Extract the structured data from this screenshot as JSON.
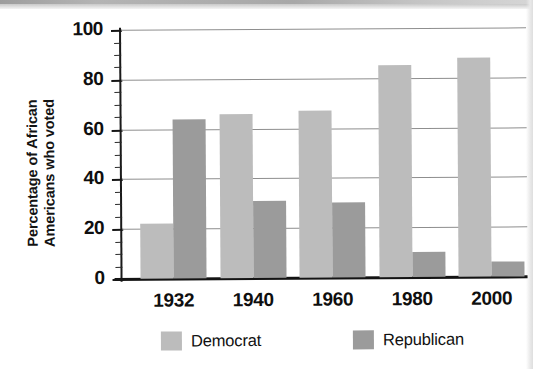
{
  "chart_data": {
    "type": "bar",
    "title": "",
    "xlabel": "",
    "ylabel": "Percentage of African Americans who voted",
    "ylabel_lines": [
      "Percentage of African",
      "Americans who voted"
    ],
    "categories": [
      "1932",
      "1940",
      "1960",
      "1980",
      "2000"
    ],
    "series": [
      {
        "name": "Democrat",
        "color": "#bcbcbc",
        "values": [
          22,
          66,
          67,
          85,
          88
        ]
      },
      {
        "name": "Republican",
        "color": "#9b9b9b",
        "values": [
          64,
          31,
          30,
          10,
          6
        ]
      }
    ],
    "ylim": [
      0,
      100
    ],
    "y_major_ticks": [
      0,
      20,
      40,
      60,
      80,
      100
    ],
    "y_tick_labels": [
      "0",
      "20",
      "40",
      "60",
      "80",
      "100"
    ],
    "y_minor_tick_interval": 5,
    "grid": "horizontal-major-only",
    "legend_position": "bottom-center"
  },
  "legend": {
    "items": [
      {
        "label": "Democrat",
        "color": "#bcbcbc"
      },
      {
        "label": "Republican",
        "color": "#9b9b9b"
      }
    ]
  }
}
